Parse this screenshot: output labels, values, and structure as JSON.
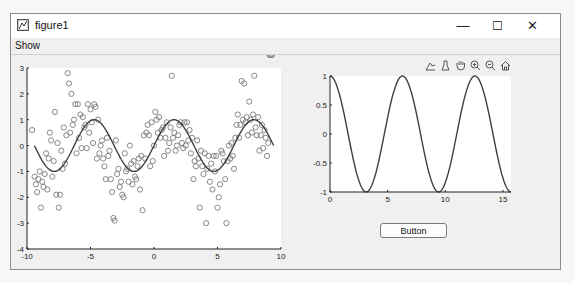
{
  "window": {
    "title": "figure1",
    "controls": {
      "minimize": "—",
      "maximize": "☐",
      "close": "✕"
    }
  },
  "menubar": {
    "items": [
      {
        "label": "Show"
      }
    ]
  },
  "axes_toolbar": {
    "tools": [
      "data-tips-icon",
      "brush-icon",
      "pan-icon",
      "zoom-in-icon",
      "zoom-out-icon",
      "restore-view-icon"
    ]
  },
  "button": {
    "label": "Button"
  },
  "colors": {
    "line": "#404040",
    "marker": "#7a7a7a",
    "axes_bg": "#ffffff",
    "figure_bg": "#f0f0f0"
  },
  "chart_data": [
    {
      "type": "scatter",
      "title": "",
      "xlabel": "",
      "ylabel": "",
      "xlim": [
        -10,
        10
      ],
      "ylim": [
        -4,
        3
      ],
      "xticks": [
        "-10",
        "-5",
        "0",
        "5",
        "10"
      ],
      "yticks": [
        "3",
        "2",
        "1",
        "0",
        "-1",
        "-2",
        "-3",
        "-4"
      ],
      "grid": false,
      "series": [
        {
          "name": "noisy samples",
          "style": "open-circle markers",
          "x": [
            -9.6,
            -9.4,
            -9.3,
            -9.2,
            -9.1,
            -9.0,
            -8.9,
            -8.8,
            -8.7,
            -8.6,
            -8.5,
            -8.4,
            -8.3,
            -8.2,
            -8.1,
            -8.0,
            -7.9,
            -7.8,
            -7.7,
            -7.6,
            -7.5,
            -7.4,
            -7.3,
            -7.2,
            -7.1,
            -7.0,
            -6.9,
            -6.8,
            -6.7,
            -6.6,
            -6.5,
            -6.4,
            -6.3,
            -6.2,
            -6.1,
            -6.0,
            -5.9,
            -5.8,
            -5.7,
            -5.6,
            -5.5,
            -5.4,
            -5.3,
            -5.2,
            -5.1,
            -5.0,
            -4.9,
            -4.8,
            -4.7,
            -4.6,
            -4.5,
            -4.4,
            -4.3,
            -4.2,
            -4.1,
            -4.0,
            -3.9,
            -3.8,
            -3.7,
            -3.6,
            -3.5,
            -3.4,
            -3.3,
            -3.2,
            -3.1,
            -3.0,
            -2.9,
            -2.8,
            -2.7,
            -2.6,
            -2.5,
            -2.4,
            -2.3,
            -2.2,
            -2.1,
            -2.0,
            -1.9,
            -1.8,
            -1.7,
            -1.6,
            -1.5,
            -1.4,
            -1.3,
            -1.2,
            -1.1,
            -1.0,
            -0.9,
            -0.8,
            -0.7,
            -0.6,
            -0.5,
            -0.4,
            -0.3,
            -0.2,
            -0.1,
            0.0,
            0.1,
            0.2,
            0.3,
            0.4,
            0.5,
            0.6,
            0.7,
            0.8,
            0.9,
            1.0,
            1.1,
            1.2,
            1.3,
            1.4,
            1.5,
            1.6,
            1.7,
            1.8,
            1.9,
            2.0,
            2.1,
            2.2,
            2.3,
            2.4,
            2.5,
            2.6,
            2.7,
            2.8,
            2.9,
            3.0,
            3.1,
            3.2,
            3.3,
            3.4,
            3.5,
            3.6,
            3.7,
            3.8,
            3.9,
            4.0,
            4.1,
            4.2,
            4.3,
            4.4,
            4.5,
            4.6,
            4.7,
            4.8,
            4.9,
            5.0,
            5.1,
            5.2,
            5.3,
            5.4,
            5.5,
            5.6,
            5.7,
            5.8,
            5.9,
            6.0,
            6.1,
            6.2,
            6.3,
            6.4,
            6.5,
            6.6,
            6.7,
            6.8,
            6.9,
            7.0,
            7.1,
            7.2,
            7.3,
            7.4,
            7.5,
            7.6,
            7.7,
            7.8,
            7.9,
            8.0,
            8.1,
            8.2,
            8.3,
            8.4,
            8.5,
            8.6,
            8.7,
            8.8,
            8.9,
            9.0,
            9.1,
            9.2,
            9.3
          ],
          "y": [
            0.6,
            -1.2,
            -1.5,
            -1.8,
            -1.3,
            -1.0,
            -2.4,
            -1.4,
            -1.6,
            -1.1,
            -0.3,
            -1.7,
            -0.5,
            0.5,
            0.2,
            -1.2,
            -0.6,
            1.3,
            -1.9,
            0.1,
            -2.4,
            -1.9,
            -0.2,
            -0.9,
            0.7,
            -0.7,
            0.4,
            2.8,
            2.4,
            0.5,
            2.0,
            0.8,
            1.0,
            1.6,
            -0.3,
            1.6,
            0.3,
            1.2,
            -0.1,
            1.1,
            0.7,
            0.8,
            -0.1,
            1.6,
            0.5,
            1.4,
            0.9,
            0.1,
            1.6,
            1.5,
            -0.5,
            1.0,
            -0.3,
            0.0,
            0.2,
            -0.5,
            -0.8,
            -1.3,
            0.3,
            -0.4,
            -0.2,
            -1.3,
            -1.8,
            -2.8,
            -2.9,
            0.2,
            -1.1,
            -0.9,
            -1.6,
            -1.4,
            -1.9,
            -2.0,
            -0.3,
            -1.0,
            -0.9,
            -1.4,
            0.0,
            -0.7,
            -1.5,
            -0.6,
            -1.2,
            -1.3,
            -0.8,
            -0.5,
            -1.7,
            -0.4,
            -2.5,
            0.4,
            -0.5,
            0.5,
            0.8,
            0.4,
            -0.8,
            0.9,
            -0.6,
            0.0,
            1.3,
            1.0,
            0.5,
            1.1,
            0.3,
            0.6,
            0.7,
            -0.4,
            0.3,
            0.9,
            -0.2,
            0.1,
            0.7,
            2.7,
            0.3,
            0.5,
            -0.2,
            0.0,
            0.4,
            0.8,
            0.9,
            0.1,
            -0.1,
            0.9,
            0.0,
            0.9,
            0.2,
            0.6,
            -0.3,
            0.3,
            -1.3,
            -0.6,
            -0.8,
            0.2,
            -0.5,
            -2.4,
            -0.2,
            -0.8,
            -1.1,
            -0.3,
            -3.0,
            -0.9,
            -0.4,
            -1.4,
            -0.7,
            -1.7,
            -0.4,
            -1.0,
            -0.4,
            -2.4,
            -2.0,
            -1.5,
            -0.2,
            -0.3,
            -0.6,
            -1.3,
            -3.0,
            -0.6,
            0.0,
            -0.5,
            0.1,
            -0.4,
            -0.9,
            0.3,
            0.8,
            1.2,
            0.3,
            0.8,
            2.5,
            1.0,
            2.4,
            0.9,
            1.1,
            0.4,
            1.7,
            1.0,
            0.5,
            1.2,
            2.7,
            0.7,
            0.4,
            1.1,
            -0.2,
            0.4,
            0.8,
            -0.1,
            0.6,
            0.3,
            -0.4,
            0.1
          ]
        },
        {
          "name": "sin(x)",
          "style": "solid line",
          "x_range": [
            -9.42,
            9.42
          ],
          "function": "sin(x)"
        }
      ]
    },
    {
      "type": "line",
      "title": "",
      "xlabel": "",
      "ylabel": "",
      "xlim": [
        0,
        15.7
      ],
      "ylim": [
        -1,
        1
      ],
      "xticks": [
        "0",
        "5",
        "10",
        "15"
      ],
      "yticks": [
        "1",
        "0.5",
        "0",
        "-0.5",
        "-1"
      ],
      "grid": false,
      "series": [
        {
          "name": "cos(x)",
          "function": "cos(x)",
          "x_range": [
            0,
            15.7
          ]
        }
      ]
    }
  ]
}
